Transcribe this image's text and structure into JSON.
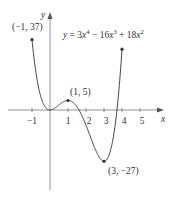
{
  "chart_data": {
    "type": "line",
    "equation_parts": {
      "y": "y",
      "eq": " = 3",
      "x1": "x",
      "p4": "4",
      "m": " − 16",
      "x2": "x",
      "p3": "3",
      "plus": " + 18",
      "x3": "x",
      "p2": "2"
    },
    "xlabel": "x",
    "ylabel": "y",
    "x_ticks": [
      "−1",
      "1",
      "2",
      "3",
      "4",
      "5"
    ],
    "x_tick_values": [
      -1,
      1,
      2,
      3,
      4,
      5
    ],
    "xlim": [
      -1.5,
      6.2
    ],
    "ylim": [
      -35,
      40
    ],
    "domain": [
      -1,
      4
    ],
    "grid": false,
    "annotations": [
      {
        "label": "(−1, 37)",
        "x": -1,
        "y": 37
      },
      {
        "label": "(1, 5)",
        "x": 1,
        "y": 5
      },
      {
        "label": "(3, −27)",
        "x": 3,
        "y": -27
      }
    ],
    "key_points": [
      {
        "x": -1,
        "y": 37
      },
      {
        "x": 0,
        "y": 0
      },
      {
        "x": 1,
        "y": 5
      },
      {
        "x": 3,
        "y": -27
      },
      {
        "x": 4,
        "y": 32
      }
    ]
  }
}
